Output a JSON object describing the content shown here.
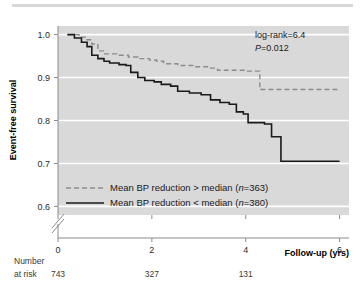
{
  "figure": {
    "background": "#ffffff",
    "plot_background": "#d9d9d9",
    "gridline_color": "#ffffff",
    "axis_color": "#808080"
  },
  "chart_data": {
    "type": "line",
    "subtype": "kaplan-meier-step",
    "title": "",
    "xlabel": "Follow-up (yrs)",
    "ylabel": "Event-free survival",
    "xlim": [
      0,
      6.2
    ],
    "ylim": [
      0.58,
      1.02
    ],
    "xticks": [
      0,
      2,
      4,
      6
    ],
    "xtick_labels": [
      "0",
      "2",
      "4",
      "6"
    ],
    "yticks": [
      0.6,
      0.7,
      0.8,
      0.9,
      1.0
    ],
    "ytick_labels": [
      "0.6",
      "0.7",
      "0.8",
      "0.9",
      "1.0"
    ],
    "grid": "horizontal-white",
    "y_axis_break": true,
    "y_axis_break_note": "double-slash break between 0.6 and axis origin",
    "legend_position": "inside-lower-left",
    "annotations": [
      {
        "name": "log-rank",
        "text": "log-rank=6.4"
      },
      {
        "name": "p-value",
        "text": "P",
        "text_rest": "=0.012"
      }
    ],
    "series": [
      {
        "name": "Mean BP reduction > median (n=363)",
        "label_prefix": "Mean BP reduction > median (",
        "label_italic": "n",
        "label_suffix": "=363)",
        "style": "dashed",
        "color": "#8c8c8c",
        "n": 363,
        "points": [
          [
            0.2,
            1.0
          ],
          [
            0.45,
            0.994
          ],
          [
            0.6,
            0.988
          ],
          [
            0.72,
            0.978
          ],
          [
            0.85,
            0.962
          ],
          [
            1.0,
            0.955
          ],
          [
            1.25,
            0.952
          ],
          [
            1.5,
            0.948
          ],
          [
            1.7,
            0.944
          ],
          [
            1.95,
            0.941
          ],
          [
            2.1,
            0.938
          ],
          [
            2.25,
            0.932
          ],
          [
            2.55,
            0.928
          ],
          [
            2.9,
            0.925
          ],
          [
            3.25,
            0.922
          ],
          [
            3.4,
            0.917
          ],
          [
            4.0,
            0.915
          ],
          [
            4.3,
            0.872
          ],
          [
            5.1,
            0.872
          ],
          [
            6.0,
            0.872
          ]
        ]
      },
      {
        "name": "Mean BP reduction < median (n=380)",
        "label_prefix": "Mean BP reduction < median (",
        "label_italic": "n",
        "label_suffix": "=380)",
        "style": "solid",
        "color": "#1a1a1a",
        "n": 380,
        "points": [
          [
            0.2,
            1.0
          ],
          [
            0.35,
            0.992
          ],
          [
            0.5,
            0.982
          ],
          [
            0.62,
            0.972
          ],
          [
            0.72,
            0.952
          ],
          [
            0.85,
            0.944
          ],
          [
            0.98,
            0.938
          ],
          [
            1.1,
            0.934
          ],
          [
            1.3,
            0.93
          ],
          [
            1.45,
            0.928
          ],
          [
            1.55,
            0.912
          ],
          [
            1.7,
            0.9
          ],
          [
            1.85,
            0.893
          ],
          [
            2.05,
            0.89
          ],
          [
            2.2,
            0.884
          ],
          [
            2.4,
            0.88
          ],
          [
            2.55,
            0.868
          ],
          [
            2.8,
            0.864
          ],
          [
            3.05,
            0.86
          ],
          [
            3.25,
            0.848
          ],
          [
            3.45,
            0.842
          ],
          [
            3.65,
            0.838
          ],
          [
            3.8,
            0.82
          ],
          [
            3.95,
            0.815
          ],
          [
            4.05,
            0.795
          ],
          [
            4.4,
            0.792
          ],
          [
            4.55,
            0.762
          ],
          [
            4.75,
            0.705
          ],
          [
            5.3,
            0.705
          ],
          [
            6.0,
            0.705
          ]
        ]
      }
    ],
    "risk_table": {
      "label_line1": "Number",
      "label_line2": "at risk",
      "x_positions": [
        0,
        2,
        4
      ],
      "values": [
        "743",
        "327",
        "131"
      ]
    }
  }
}
